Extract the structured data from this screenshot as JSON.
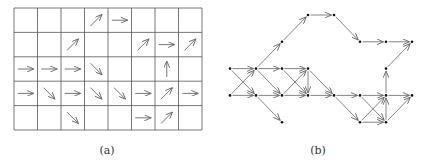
{
  "figure": {
    "panels": [
      {
        "id": "a",
        "caption": "(a)",
        "type": "vector-field-grid",
        "rows": 5,
        "cols": 8,
        "arrows": [
          {
            "row": 0,
            "col": 3,
            "dir": "NE"
          },
          {
            "row": 0,
            "col": 4,
            "dir": "E"
          },
          {
            "row": 1,
            "col": 2,
            "dir": "NE"
          },
          {
            "row": 1,
            "col": 5,
            "dir": "NE"
          },
          {
            "row": 1,
            "col": 6,
            "dir": "E"
          },
          {
            "row": 1,
            "col": 7,
            "dir": "NE"
          },
          {
            "row": 2,
            "col": 0,
            "dir": "E"
          },
          {
            "row": 2,
            "col": 1,
            "dir": "E"
          },
          {
            "row": 2,
            "col": 2,
            "dir": "E"
          },
          {
            "row": 2,
            "col": 3,
            "dir": "SE"
          },
          {
            "row": 2,
            "col": 6,
            "dir": "N"
          },
          {
            "row": 3,
            "col": 0,
            "dir": "E"
          },
          {
            "row": 3,
            "col": 1,
            "dir": "SE"
          },
          {
            "row": 3,
            "col": 2,
            "dir": "E"
          },
          {
            "row": 3,
            "col": 3,
            "dir": "SE"
          },
          {
            "row": 3,
            "col": 4,
            "dir": "SE"
          },
          {
            "row": 3,
            "col": 5,
            "dir": "E"
          },
          {
            "row": 3,
            "col": 6,
            "dir": "NE"
          },
          {
            "row": 3,
            "col": 7,
            "dir": "E"
          },
          {
            "row": 4,
            "col": 2,
            "dir": "SE"
          },
          {
            "row": 4,
            "col": 5,
            "dir": "E"
          },
          {
            "row": 4,
            "col": 6,
            "dir": "NE"
          }
        ]
      },
      {
        "id": "b",
        "caption": "(b)",
        "type": "directed-graph",
        "nodes": [
          {
            "id": "n0",
            "gx": 0,
            "gy": 2
          },
          {
            "id": "n1",
            "gx": 0,
            "gy": 3
          },
          {
            "id": "n2",
            "gx": 1,
            "gy": 2
          },
          {
            "id": "n3",
            "gx": 1,
            "gy": 3
          },
          {
            "id": "n4",
            "gx": 2,
            "gy": 1
          },
          {
            "id": "n5",
            "gx": 2,
            "gy": 2
          },
          {
            "id": "n6",
            "gx": 2,
            "gy": 3
          },
          {
            "id": "n7",
            "gx": 2,
            "gy": 4
          },
          {
            "id": "n8",
            "gx": 3,
            "gy": 0
          },
          {
            "id": "n9",
            "gx": 3,
            "gy": 2
          },
          {
            "id": "n10",
            "gx": 3,
            "gy": 3
          },
          {
            "id": "n11",
            "gx": 4,
            "gy": 0
          },
          {
            "id": "n12",
            "gx": 4,
            "gy": 3
          },
          {
            "id": "n13",
            "gx": 5,
            "gy": 1
          },
          {
            "id": "n14",
            "gx": 5,
            "gy": 3
          },
          {
            "id": "n15",
            "gx": 5,
            "gy": 4
          },
          {
            "id": "n16",
            "gx": 6,
            "gy": 1
          },
          {
            "id": "n17",
            "gx": 6,
            "gy": 2
          },
          {
            "id": "n18",
            "gx": 6,
            "gy": 3
          },
          {
            "id": "n19",
            "gx": 6,
            "gy": 4
          },
          {
            "id": "n20",
            "gx": 7,
            "gy": 1
          },
          {
            "id": "n21",
            "gx": 7,
            "gy": 3
          }
        ],
        "edges": [
          [
            "n0",
            "n2"
          ],
          [
            "n0",
            "n3"
          ],
          [
            "n1",
            "n2"
          ],
          [
            "n1",
            "n3"
          ],
          [
            "n2",
            "n4"
          ],
          [
            "n2",
            "n5"
          ],
          [
            "n2",
            "n6"
          ],
          [
            "n3",
            "n6"
          ],
          [
            "n3",
            "n7"
          ],
          [
            "n4",
            "n8"
          ],
          [
            "n8",
            "n11"
          ],
          [
            "n11",
            "n13"
          ],
          [
            "n13",
            "n16"
          ],
          [
            "n16",
            "n20"
          ],
          [
            "n5",
            "n9"
          ],
          [
            "n5",
            "n10"
          ],
          [
            "n6",
            "n9"
          ],
          [
            "n6",
            "n10"
          ],
          [
            "n9",
            "n10"
          ],
          [
            "n9",
            "n12"
          ],
          [
            "n10",
            "n12"
          ],
          [
            "n12",
            "n14"
          ],
          [
            "n12",
            "n15"
          ],
          [
            "n14",
            "n18"
          ],
          [
            "n14",
            "n19"
          ],
          [
            "n15",
            "n18"
          ],
          [
            "n15",
            "n19"
          ],
          [
            "n19",
            "n18"
          ],
          [
            "n18",
            "n17"
          ],
          [
            "n19",
            "n21"
          ],
          [
            "n18",
            "n21"
          ],
          [
            "n17",
            "n20"
          ]
        ]
      }
    ]
  }
}
